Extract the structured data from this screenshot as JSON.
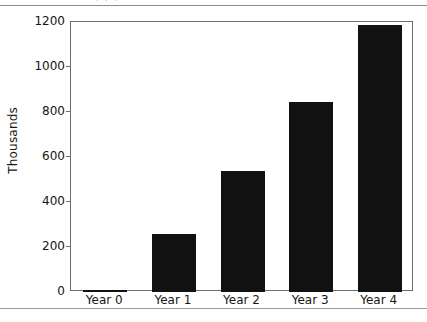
{
  "figure": {
    "background_color": "#ffffff",
    "rule_color": "#8e8e8e",
    "clipped_caption_text": "· · ·"
  },
  "chart_data": {
    "type": "bar",
    "title": "",
    "subtitle": "",
    "xlabel": "",
    "ylabel": "Thousands",
    "categories": [
      "Year 0",
      "Year 1",
      "Year 2",
      "Year 3",
      "Year 4"
    ],
    "values": [
      8,
      258,
      538,
      844,
      1187
    ],
    "series": [
      {
        "name": "",
        "values": [
          8,
          258,
          538,
          844,
          1187
        ]
      }
    ],
    "ylim": [
      0,
      1200
    ],
    "yticks": [
      0,
      200,
      400,
      600,
      800,
      1000,
      1200
    ],
    "ytick_labels": [
      "0",
      "200",
      "400",
      "600",
      "800",
      "1000",
      "1200"
    ],
    "grid": false,
    "legend": null,
    "legend_position": "none",
    "bar_color": "#111111",
    "axis_color": "#6d6d6d",
    "text_color": "#161616",
    "annotations": []
  }
}
